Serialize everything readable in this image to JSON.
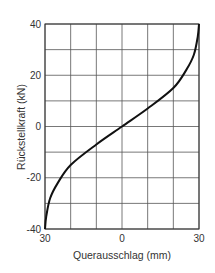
{
  "chart_data": {
    "type": "line",
    "title": "",
    "xlabel": "Querausschlag  (mm)",
    "ylabel": "Rückstellkraft (kN)",
    "xlim": [
      -30,
      30
    ],
    "ylim": [
      -40,
      40
    ],
    "x_tick_labels": [
      "30",
      "0",
      "30"
    ],
    "y_tick_labels": [
      "40",
      "20",
      "0",
      "-20",
      "-40"
    ],
    "grid": true,
    "grid_x_step": 10,
    "grid_y_step": 10,
    "legend": null,
    "series": [
      {
        "name": "Rückstellkraft",
        "x": [
          -30,
          -29.5,
          -28,
          -25,
          -20,
          -10,
          0,
          10,
          20,
          25,
          28,
          29.5,
          30
        ],
        "y": [
          -40,
          -35,
          -28,
          -22,
          -15,
          -7,
          0,
          7,
          15,
          22,
          28,
          35,
          40
        ],
        "color": "#111111"
      }
    ]
  }
}
